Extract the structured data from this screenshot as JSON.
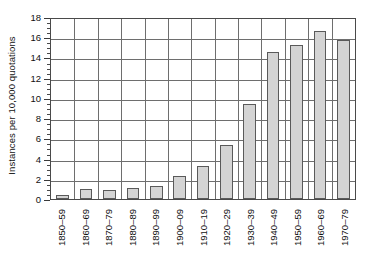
{
  "chart_data": {
    "type": "bar",
    "title": "",
    "subtitle": "",
    "xlabel": "",
    "ylabel": "Instances per 10,000 quotations",
    "categories": [
      "1850–59",
      "1860–69",
      "1870–79",
      "1880–89",
      "1890–99",
      "1900–09",
      "1910–19",
      "1920–29",
      "1930–39",
      "1940–49",
      "1950–59",
      "1960–69",
      "1970–79"
    ],
    "values": [
      0.4,
      1.0,
      0.9,
      1.1,
      1.3,
      2.3,
      3.3,
      5.3,
      9.35,
      14.5,
      15.2,
      16.6,
      15.7
    ],
    "ylim": [
      0,
      18
    ],
    "ytick_values": [
      0,
      2,
      4,
      6,
      8,
      10,
      12,
      14,
      16,
      18
    ],
    "ytick_labels": [
      "0",
      "2",
      "4",
      "6",
      "8",
      "10",
      "12",
      "14",
      "16",
      "18"
    ],
    "ytick_minor_step": 0.5,
    "grid": "both",
    "legend": "none",
    "bar_fill": "#d4d4d4",
    "bar_edge": "#5a5a5a",
    "grid_color": "#6e6e6e",
    "axis_color": "#4a4a4a",
    "text_color": "#111111"
  }
}
